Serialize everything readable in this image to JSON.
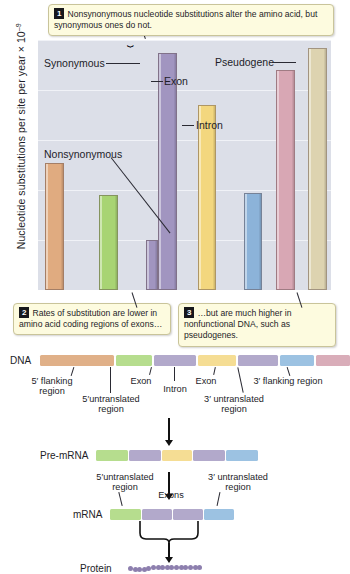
{
  "chart_data": {
    "type": "bar",
    "title": "",
    "xlabel": "",
    "ylabel": "Nucleotide substitutions per site per year × 10⁻⁹",
    "ylim": [
      0,
      5
    ],
    "yticks": [
      1,
      2,
      3,
      4,
      5
    ],
    "grid": true,
    "legend": "none",
    "categories": [
      "5′ flanking region",
      "5′ untranslated region",
      "Exon (nonsynonymous)",
      "Exon (synonymous)",
      "Intron",
      "3′ untranslated region",
      "3′ flanking region",
      "Pseudogene"
    ],
    "values": [
      2.55,
      1.9,
      1.0,
      4.75,
      3.7,
      1.95,
      4.4,
      4.85
    ],
    "colors": [
      "#e0ab80",
      "#a8d473",
      "#a195c0",
      "#a195c0",
      "#f3d77e",
      "#8cb3d9",
      "#d8a7b4",
      "#ddd3b0"
    ],
    "annotations": [
      {
        "label": "Synonymous",
        "target": "Exon (synonymous)"
      },
      {
        "label": "Nonsynonymous",
        "target": "Exon (nonsynonymous)"
      },
      {
        "label": "Exon",
        "target": "Exon (synonymous)"
      },
      {
        "label": "Intron",
        "target": "Intron"
      },
      {
        "label": "Pseudogene",
        "target": "Pseudogene"
      }
    ]
  },
  "axis": {
    "y_title_main": "Nucleotide substitutions per site per year × 10",
    "y_title_exp": "–9",
    "ticks": [
      "5",
      "4",
      "3",
      "2",
      "1"
    ]
  },
  "chart_labels": {
    "synonymous": "Synonymous",
    "nonsynonymous": "Nonsynonymous",
    "exon": "Exon",
    "intron": "Intron",
    "pseudogene": "Pseudogene"
  },
  "callouts": [
    {
      "num": "1",
      "text": "Nonsynonymous nucleotide substitutions alter the amino acid, but synonymous ones do not."
    },
    {
      "num": "2",
      "text": "Rates of substitution are lower in amino acid coding regions of exons…"
    },
    {
      "num": "3",
      "text": "…but are much higher in nonfunctional DNA, such as pseudogenes."
    }
  ],
  "diagram": {
    "rows": [
      {
        "label": "DNA"
      },
      {
        "label": "Pre-mRNA"
      },
      {
        "label": "mRNA"
      },
      {
        "label": "Protein"
      }
    ],
    "dna_labels": {
      "five_flanking": "5′ flanking\nregion",
      "five_flanking_l1": "5′ flanking",
      "five_flanking_l2": "region",
      "five_utr_l1": "5′untranslated",
      "five_utr_l2": "region",
      "exon1": "Exon",
      "intron": "Intron",
      "exon2": "Exon",
      "three_utr_l1": "3′ untranslated",
      "three_utr_l2": "region",
      "three_flanking": "3′ flanking region"
    },
    "mrna_labels": {
      "five_utr_l1": "5′untranslated",
      "five_utr_l2": "region",
      "exons": "Exons",
      "three_utr_l1": "3′ untranslated",
      "three_utr_l2": "region"
    },
    "dna_segments": [
      {
        "name": "5-flanking",
        "color": "#e0b088",
        "x": 0,
        "w": 74
      },
      {
        "name": "5-utr",
        "color": "#b6dd8e",
        "x": 76,
        "w": 36
      },
      {
        "name": "exon-1",
        "color": "#b2a9cb",
        "x": 114,
        "w": 42
      },
      {
        "name": "intron",
        "color": "#f5dd94",
        "x": 158,
        "w": 38
      },
      {
        "name": "exon-2",
        "color": "#b2a9cb",
        "x": 198,
        "w": 40
      },
      {
        "name": "3-utr",
        "color": "#9cc2e2",
        "x": 240,
        "w": 34
      },
      {
        "name": "3-flanking",
        "color": "#d9adb9",
        "x": 276,
        "w": 34
      }
    ],
    "premrna_segments": [
      {
        "name": "5-utr",
        "color": "#b6dd8e",
        "x": 0,
        "w": 32
      },
      {
        "name": "exon-1",
        "color": "#b2a9cb",
        "x": 33,
        "w": 32
      },
      {
        "name": "intron",
        "color": "#f5dd94",
        "x": 66,
        "w": 30
      },
      {
        "name": "exon-2",
        "color": "#b2a9cb",
        "x": 97,
        "w": 32
      },
      {
        "name": "3-utr",
        "color": "#9cc2e2",
        "x": 130,
        "w": 32
      }
    ],
    "mrna_segments": [
      {
        "name": "5-utr",
        "color": "#b6dd8e",
        "x": 0,
        "w": 31
      },
      {
        "name": "exon-1",
        "color": "#b2a9cb",
        "x": 32,
        "w": 30
      },
      {
        "name": "exon-2",
        "color": "#b2a9cb",
        "x": 63,
        "w": 30
      },
      {
        "name": "3-utr",
        "color": "#9cc2e2",
        "x": 94,
        "w": 30
      }
    ],
    "protein_beads": 16
  },
  "colors": {
    "plot_background": "#dcdfe8",
    "gridline": "#f0f2f7",
    "callout_fill": "#fdfbdf",
    "callout_border": "#c9c49a",
    "protein_bead": "#8d7fae"
  }
}
